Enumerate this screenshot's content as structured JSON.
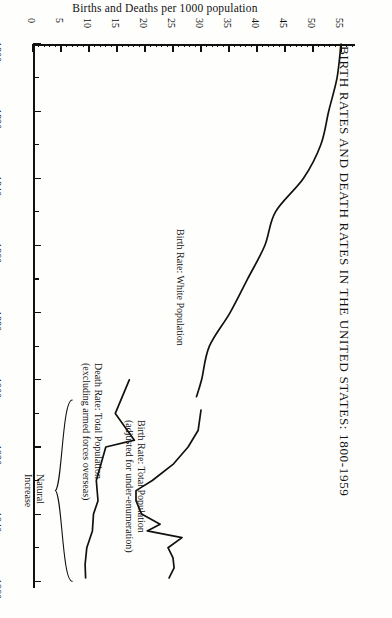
{
  "chart_data": {
    "type": "line",
    "title": "BIRTH RATES AND DEATH RATES IN THE UNITED STATES: 1800-1959",
    "xlabel": "Births and Deaths per 1000 population",
    "ylabel": "",
    "orientation": "rotated-90-year-axis-vertical",
    "grid": false,
    "legend": "inline-annotations",
    "xlim": [
      0,
      57.5
    ],
    "ylim": [
      1800,
      1962
    ],
    "xticks": [
      0,
      5,
      10,
      15,
      20,
      25,
      30,
      35,
      40,
      45,
      50,
      55
    ],
    "xtick_labels": [
      "0",
      "5",
      "10",
      "15",
      "20",
      "25",
      "30",
      "35",
      "40",
      "45",
      "50",
      "55"
    ],
    "yticks": [
      1800,
      1810,
      1820,
      1830,
      1840,
      1850,
      1860,
      1870,
      1880,
      1890,
      1900,
      1910,
      1920,
      1930,
      1940,
      1950,
      1960
    ],
    "ytick_labels": [
      "1800",
      "",
      "1820",
      "",
      "1840",
      "",
      "1860",
      "",
      "1880",
      "",
      "1900",
      "",
      "1920",
      "",
      "1940",
      "",
      "1960"
    ],
    "series": [
      {
        "name": "Birth Rate: White Population",
        "x": [
          1800,
          1810,
          1820,
          1830,
          1840,
          1850,
          1860,
          1870,
          1880,
          1890,
          1900,
          1905
        ],
        "y": [
          55.0,
          54.3,
          52.8,
          51.4,
          48.3,
          43.3,
          41.4,
          38.3,
          35.2,
          31.5,
          30.1,
          29.2
        ]
      },
      {
        "name": "Birth Rate: Total Population (adjusted for under-enumeration)",
        "x": [
          1909,
          1915,
          1920,
          1925,
          1930,
          1933,
          1936,
          1940,
          1943,
          1945,
          1947,
          1950,
          1953,
          1956,
          1959
        ],
        "y": [
          30.0,
          29.5,
          27.7,
          25.1,
          21.3,
          18.4,
          18.4,
          19.4,
          22.7,
          20.4,
          26.6,
          24.1,
          25.0,
          25.2,
          24.3
        ]
      },
      {
        "name": "Death Rate: Total Population (excluding armed forces overseas)",
        "x": [
          1900,
          1910,
          1918,
          1920,
          1930,
          1936,
          1940,
          1945,
          1950,
          1955,
          1959
        ],
        "y": [
          17.2,
          14.7,
          18.1,
          13.0,
          11.3,
          11.6,
          10.8,
          10.6,
          9.6,
          9.3,
          9.4
        ]
      }
    ],
    "annotations": [
      {
        "name": "birth-rate-white-label",
        "text_line1": "Birth Rate: White Population",
        "text_line2": ""
      },
      {
        "name": "birth-rate-total-label",
        "text_line1": "Birth Rate: Total Population",
        "text_line2": "(adjusted for under-enumeration)"
      },
      {
        "name": "death-rate-total-label",
        "text_line1": "Death Rate: Total Population",
        "text_line2": "(excluding armed forces overseas)"
      },
      {
        "name": "natural-increase-label",
        "text_line1": "Natural",
        "text_line2": "Increase"
      }
    ],
    "colors": {
      "line": "#111111",
      "background": "#fefefd",
      "text": "#111111"
    }
  }
}
